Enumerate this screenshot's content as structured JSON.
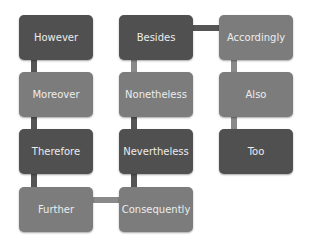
{
  "diagram": {
    "columns": [
      {
        "nodes": [
          {
            "label": "However",
            "shade": "dark"
          },
          {
            "label": "Moreover",
            "shade": "light"
          },
          {
            "label": "Therefore",
            "shade": "dark"
          },
          {
            "label": "Further",
            "shade": "light"
          }
        ]
      },
      {
        "nodes": [
          {
            "label": "Besides",
            "shade": "dark"
          },
          {
            "label": "Nonetheless",
            "shade": "light"
          },
          {
            "label": "Nevertheless",
            "shade": "dark"
          },
          {
            "label": "Consequently",
            "shade": "light"
          }
        ]
      },
      {
        "nodes": [
          {
            "label": "Accordingly",
            "shade": "light"
          },
          {
            "label": "Also",
            "shade": "light"
          },
          {
            "label": "Too",
            "shade": "dark"
          }
        ]
      }
    ],
    "connections": [
      [
        "However",
        "Moreover"
      ],
      [
        "Moreover",
        "Therefore"
      ],
      [
        "Therefore",
        "Further"
      ],
      [
        "Further",
        "Consequently"
      ],
      [
        "Consequently",
        "Nevertheless"
      ],
      [
        "Nevertheless",
        "Nonetheless"
      ],
      [
        "Nonetheless",
        "Besides"
      ],
      [
        "Besides",
        "Accordingly"
      ],
      [
        "Accordingly",
        "Also"
      ],
      [
        "Also",
        "Too"
      ]
    ],
    "colors": {
      "dark": "#505050",
      "light": "#7c7c7c",
      "text": "#ececec"
    }
  }
}
